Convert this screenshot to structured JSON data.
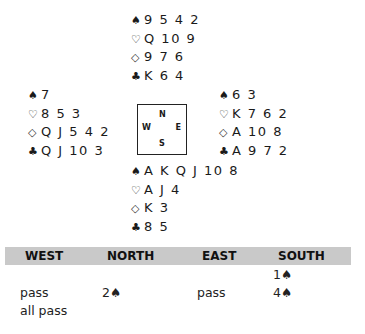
{
  "hands": {
    "north": {
      "spades": "9 5 4 2",
      "hearts": "Q 10 9",
      "diamonds": "9 7 6",
      "clubs": "K 6 4"
    },
    "west": {
      "spades": "7",
      "hearts": "8 5 3",
      "diamonds": "Q J 5 4 2",
      "clubs": "Q J 10 3"
    },
    "east": {
      "spades": "6 3",
      "hearts": "K 7 6 2",
      "diamonds": "A 10 8",
      "clubs": "A 9 7 2"
    },
    "south": {
      "spades": "A K Q J 10 8",
      "hearts": "A J 4",
      "diamonds": "K 3",
      "clubs": "8 5"
    }
  },
  "suit_symbols": {
    "spades": "♠",
    "hearts": "♡",
    "diamonds": "◇",
    "clubs": "♣"
  },
  "compass": {
    "n": "N",
    "w": "W",
    "e": "E",
    "s": "S"
  },
  "bidding": {
    "headers": [
      "WEST",
      "NORTH",
      "EAST",
      "SOUTH"
    ],
    "rows": [
      {
        "west": "",
        "north": "",
        "east": "",
        "south": "1♠"
      },
      {
        "west": "pass",
        "north": "2♠",
        "east": "pass",
        "south": "4♠"
      },
      {
        "west": "all pass",
        "north": "",
        "east": "",
        "south": ""
      }
    ]
  }
}
